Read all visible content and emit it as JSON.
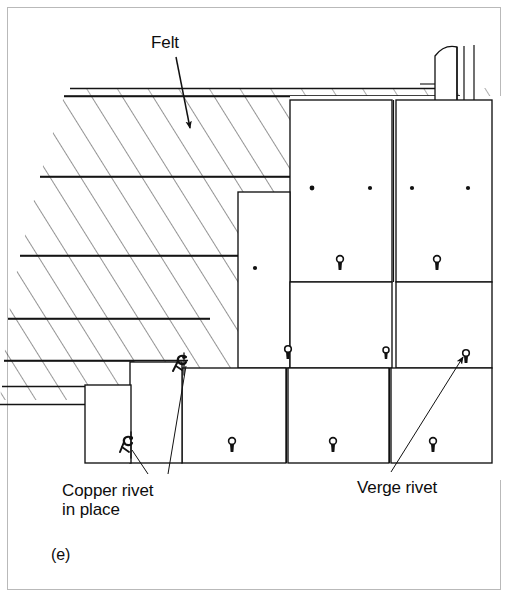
{
  "figure": {
    "caption": "(e)",
    "background_color": "#ffffff",
    "ink_color": "#111111",
    "frame_color": "#b9b9b9"
  },
  "labels": {
    "felt": "Felt",
    "copper_rivet_line1": "Copper rivet",
    "copper_rivet_line2": "in place",
    "verge_rivet": "Verge rivet"
  },
  "annotations": [
    {
      "name": "felt-leader",
      "text": "Felt",
      "arrow_from": [
        176,
        57
      ],
      "arrow_to": [
        190,
        133
      ]
    },
    {
      "name": "copper-rivet-leader-a",
      "text": "Copper rivet in place",
      "arrow_from": [
        148,
        474
      ],
      "arrow_to": [
        131,
        446
      ]
    },
    {
      "name": "copper-rivet-leader-b",
      "text": "Copper rivet in place",
      "arrow_from": [
        167,
        474
      ],
      "arrow_to": [
        185,
        364
      ]
    },
    {
      "name": "verge-rivet-leader",
      "text": "Verge rivet",
      "arrow_from": [
        390,
        473
      ],
      "arrow_to": [
        467,
        358
      ]
    }
  ],
  "hatched_layers": [
    {
      "name": "felt-upper-band",
      "top": 88,
      "bottom": 96,
      "left_at_top": 70,
      "left_at_bottom": 64
    },
    {
      "name": "felt-main-band",
      "top": 96,
      "bottom": 176,
      "left_at_top": 64,
      "left_at_bottom": 40
    },
    {
      "name": "batten-band",
      "top": 176,
      "bottom": 255,
      "left_at_top": 40,
      "left_at_bottom": 20
    },
    {
      "name": "lower-band",
      "top": 255,
      "bottom": 318,
      "left_at_top": 20,
      "left_at_bottom": 8
    },
    {
      "name": "eaves-band",
      "top": 318,
      "bottom": 360,
      "left_at_top": 8,
      "left_at_bottom": 4
    },
    {
      "name": "undercloak-band",
      "top": 360,
      "bottom": 400,
      "left_at_top": 4,
      "left_at_bottom": 2
    }
  ],
  "slates": [
    {
      "name": "top-slate-left",
      "x": 290,
      "y": 100,
      "w": 102,
      "h": 182,
      "nails": [
        [
          312,
          188
        ],
        [
          370,
          188
        ]
      ],
      "rivet": [
        339,
        262
      ]
    },
    {
      "name": "top-slate-right",
      "x": 396,
      "y": 100,
      "w": 96,
      "h": 182,
      "nails": [
        [
          408,
          188
        ],
        [
          464,
          188
        ]
      ],
      "rivet": [
        437,
        262
      ]
    },
    {
      "name": "mid-slate-left",
      "x": 238,
      "y": 192,
      "w": 52,
      "h": 176,
      "nails": [
        [
          255,
          268
        ]
      ],
      "rivet": null
    },
    {
      "name": "mid-slate-center",
      "x": 290,
      "y": 286,
      "w": 102,
      "h": 82,
      "nails": [],
      "rivet": [
        288,
        352
      ]
    },
    {
      "name": "mid-slate-right",
      "x": 396,
      "y": 286,
      "w": 96,
      "h": 82,
      "nails": [],
      "rivet": [
        385,
        352
      ]
    },
    {
      "name": "mid-slate-far",
      "x": 430,
      "y": 286,
      "w": 62,
      "h": 82,
      "nails": [],
      "rivet": [
        464,
        352
      ]
    },
    {
      "name": "bottom-slate-left",
      "x": 182,
      "y": 372,
      "w": 103,
      "h": 91,
      "nails": [],
      "rivet": [
        232,
        444
      ]
    },
    {
      "name": "bottom-slate-mid",
      "x": 287,
      "y": 372,
      "w": 101,
      "h": 91,
      "nails": [],
      "rivet": [
        332,
        444
      ]
    },
    {
      "name": "bottom-slate-right",
      "x": 390,
      "y": 372,
      "w": 102,
      "h": 91,
      "nails": [],
      "rivet": [
        432,
        444
      ]
    },
    {
      "name": "undercloak-left",
      "x": 130,
      "y": 362,
      "w": 52,
      "h": 101,
      "nails": [],
      "rivet": null
    },
    {
      "name": "undercloak-lower",
      "x": 85,
      "y": 385,
      "w": 45,
      "h": 78,
      "nails": [],
      "rivet": null
    }
  ],
  "rivets": [
    {
      "name": "copper-rivet-upper",
      "type": "bent-hook",
      "x": 184,
      "y": 362
    },
    {
      "name": "copper-rivet-lower",
      "type": "bent-hook",
      "x": 130,
      "y": 444
    }
  ],
  "ridge_upstand": {
    "name": "ridge-upstand",
    "x": 434,
    "y": 45,
    "w": 42,
    "h": 56
  }
}
